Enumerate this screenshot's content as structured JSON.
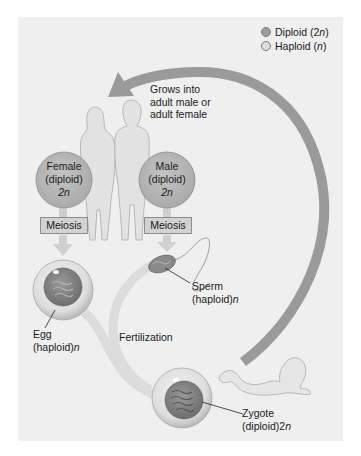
{
  "legend": {
    "items": [
      {
        "label": "Diploid (2",
        "italic": "n",
        "suffix": ")",
        "color": "#9e9e9e"
      },
      {
        "label": "Haploid (",
        "italic": "n",
        "suffix": ")",
        "color": "#dcdcdc"
      }
    ]
  },
  "colors": {
    "background_panel": "#efefef",
    "diploid": "#9e9e9e",
    "haploid": "#dcdcdc",
    "arrow": "#9a9a9a"
  },
  "growth_label": {
    "line1": "Grows into",
    "line2": "adult male or",
    "line3": "adult female"
  },
  "female": {
    "line1": "Female",
    "line2": "(diploid)",
    "line3_num": "2",
    "line3_var": "n"
  },
  "male": {
    "line1": "Male",
    "line2": "(diploid)",
    "line3_num": "2",
    "line3_var": "n"
  },
  "meiosis": {
    "left_label": "Meiosis",
    "right_label": "Meiosis"
  },
  "egg": {
    "line1": "Egg",
    "line2": "(haploid)",
    "var": "n"
  },
  "sperm": {
    "line1": "Sperm",
    "line2": "(haploid)",
    "var": "n"
  },
  "fertilization_label": "Fertilization",
  "zygote": {
    "line1": "Zygote",
    "line2": "(diploid)2",
    "var": "n"
  }
}
